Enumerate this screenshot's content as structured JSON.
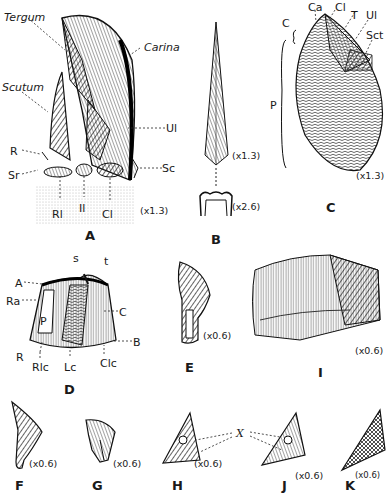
{
  "plate": {
    "figures": [
      {
        "id": "A",
        "scale": "(x1.3)",
        "labels": [
          "Tergum",
          "Carina",
          "Scutum",
          "Ul",
          "R",
          "Sc",
          "Sr",
          "Rl",
          "Il",
          "Cl"
        ]
      },
      {
        "id": "B",
        "scales": [
          "(x1.3)",
          "(x2.6)"
        ]
      },
      {
        "id": "C",
        "scale": "(x1.3)",
        "labels": [
          "Ca",
          "Cl",
          "T",
          "Ul",
          "Sct",
          "C",
          "P"
        ]
      },
      {
        "id": "D",
        "labels": [
          "s",
          "t",
          "A",
          "Ra",
          "P",
          "C",
          "B",
          "R",
          "Rlc",
          "Lc",
          "Clc"
        ]
      },
      {
        "id": "E",
        "scale": "(x0.6)"
      },
      {
        "id": "I",
        "scale": "(x0.6)"
      },
      {
        "id": "F",
        "scale": "(x0.6)"
      },
      {
        "id": "G",
        "scale": "(x0.6)"
      },
      {
        "id": "H",
        "scale": "(x0.6)"
      },
      {
        "id": "J",
        "scale": "(x0.6)",
        "labels": [
          "X"
        ]
      },
      {
        "id": "K",
        "scale": "(x0.6)"
      }
    ]
  },
  "a": {
    "tergum": "Tergum",
    "carina": "Carina",
    "scutum": "Scutum",
    "ul": "Ul",
    "r": "R",
    "sc": "Sc",
    "sr": "Sr",
    "rl": "Rl",
    "il": "Il",
    "cl": "Cl",
    "scale": "(x1.3)",
    "letter": "A"
  },
  "b": {
    "scale1": "(x1.3)",
    "scale2": "(x2.6)",
    "letter": "B"
  },
  "c": {
    "ca": "Ca",
    "cl": "Cl",
    "t": "T",
    "ul": "Ul",
    "sct": "Sct",
    "c": "C",
    "p": "P",
    "scale": "(x1.3)",
    "letter": "C"
  },
  "d": {
    "s": "s",
    "t": "t",
    "a": "A",
    "ra": "Ra",
    "p": "P",
    "c": "C",
    "b": "B",
    "r": "R",
    "rlc": "Rlc",
    "lc": "Lc",
    "clc": "Clc",
    "letter": "D"
  },
  "e": {
    "scale": "(x0.6)",
    "letter": "E"
  },
  "i": {
    "scale": "(x0.6)",
    "letter": "I"
  },
  "f": {
    "scale": "(x0.6)",
    "letter": "F"
  },
  "g": {
    "scale": "(x0.6)",
    "letter": "G"
  },
  "h": {
    "scale": "(x0.6)",
    "letter": "H"
  },
  "j": {
    "x": "X",
    "scale": "(x0.6)",
    "letter": "J"
  },
  "k": {
    "scale": "(x0.6)",
    "letter": "K"
  }
}
